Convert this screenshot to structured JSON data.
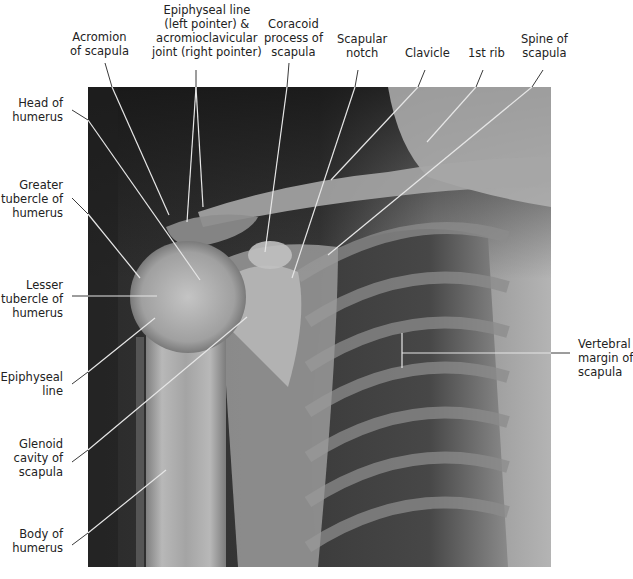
{
  "figure": {
    "type": "Radiograph of the shoulder (AP view) with anatomical labels",
    "colors": {
      "background": "#ffffff",
      "label_text": "#222222",
      "pointer_line": "#e8e8e8",
      "pointer_line_outside": "#333333"
    }
  },
  "labels": {
    "top": [
      {
        "id": "acromion",
        "lines": [
          "Acromion",
          "of scapula"
        ]
      },
      {
        "id": "epiphyseal-ac",
        "lines": [
          "Epiphyseal line",
          "(left pointer) &",
          "acromioclavicular",
          "joint (right pointer)"
        ]
      },
      {
        "id": "coracoid",
        "lines": [
          "Coracoid",
          "process of",
          "scapula"
        ]
      },
      {
        "id": "scapular-notch",
        "lines": [
          "Scapular",
          "notch"
        ]
      },
      {
        "id": "clavicle",
        "lines": [
          "Clavicle"
        ]
      },
      {
        "id": "first-rib",
        "lines": [
          "1st rib"
        ]
      },
      {
        "id": "spine-scapula",
        "lines": [
          "Spine of",
          "scapula"
        ]
      }
    ],
    "left": [
      {
        "id": "head-humerus",
        "lines": [
          "Head of",
          "humerus"
        ]
      },
      {
        "id": "greater-tubercle",
        "lines": [
          "Greater",
          "tubercle of",
          "humerus"
        ]
      },
      {
        "id": "lesser-tubercle",
        "lines": [
          "Lesser",
          "tubercle of",
          "humerus"
        ]
      },
      {
        "id": "epiphyseal-line",
        "lines": [
          "Epiphyseal",
          "line"
        ]
      },
      {
        "id": "glenoid",
        "lines": [
          "Glenoid",
          "cavity of",
          "scapula"
        ]
      },
      {
        "id": "body-humerus",
        "lines": [
          "Body of",
          "humerus"
        ]
      }
    ],
    "right": [
      {
        "id": "vertebral-margin",
        "lines": [
          "Vertebral",
          "margin of",
          "scapula"
        ]
      }
    ]
  }
}
